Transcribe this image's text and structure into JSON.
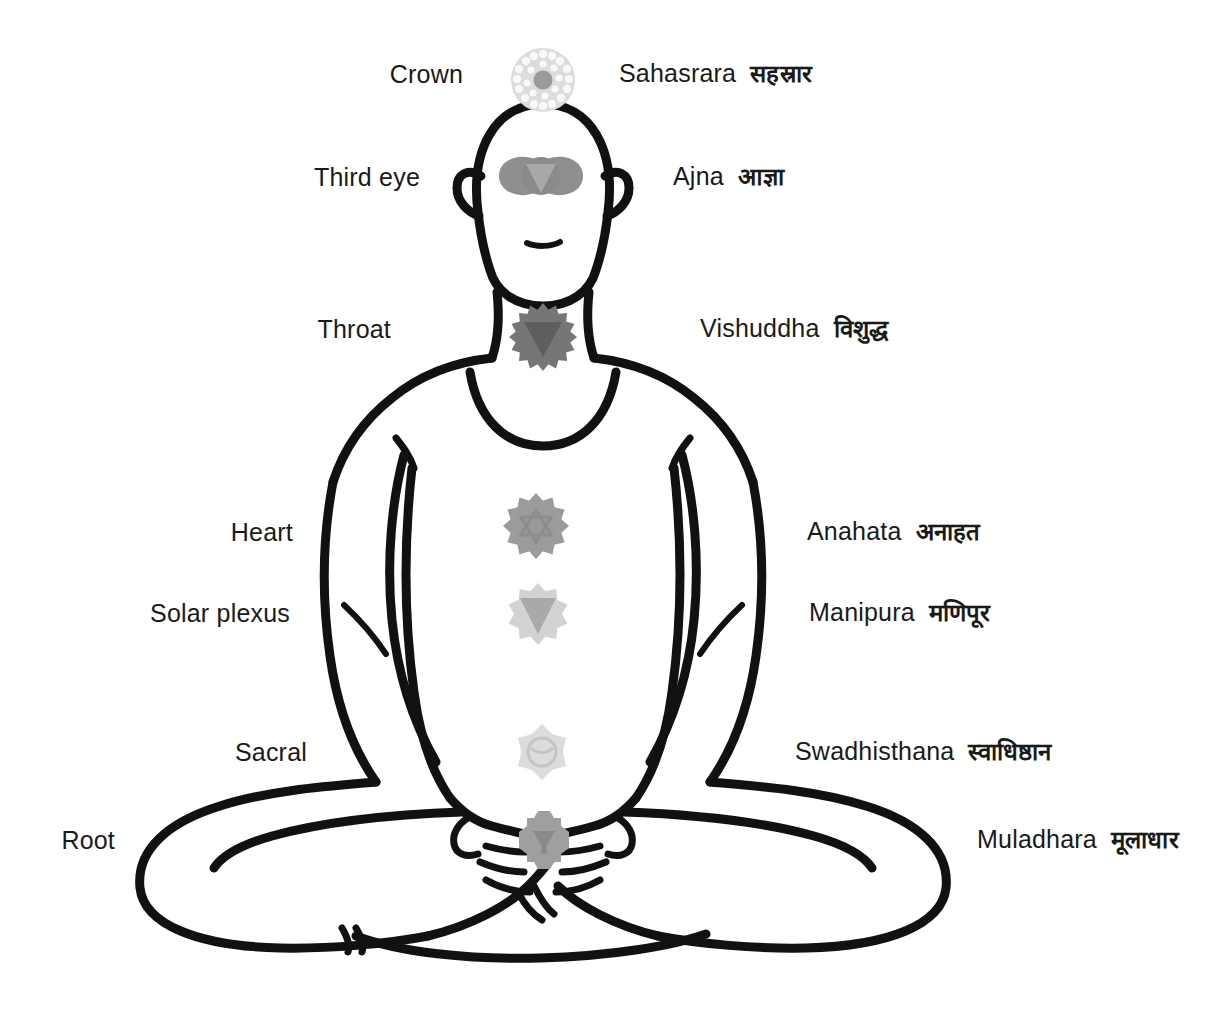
{
  "diagram": {
    "background_color": "#ffffff",
    "line_color": "#111111",
    "text_color": "#1a1a1a",
    "figure": {
      "pose": "padmasana-seated-lotus",
      "description": "Line-art silhouette of a bald person seated cross-legged in lotus position with hands resting in the lap"
    }
  },
  "chakras": [
    {
      "index": 1,
      "english_name": "Crown",
      "sanskrit_name": "Sahasrara",
      "devanagari": "सहस्रार",
      "petals": 1000,
      "shape": "thousand-petal-circle",
      "color": "#d9d9d9",
      "center_color": "#9a9a9a",
      "left_label_x": 463,
      "left_label_y": 75,
      "right_label_x": 619,
      "right_label_y": 74,
      "icon_cx": 543,
      "icon_cy": 80,
      "icon_r": 33
    },
    {
      "index": 2,
      "english_name": "Third eye",
      "sanskrit_name": "Ajna",
      "devanagari": "आज्ञा",
      "petals": 2,
      "shape": "two-petal-eye",
      "color": "#8f8f8f",
      "center_color": "#a5a5a5",
      "left_label_x": 420,
      "left_label_y": 177,
      "right_label_x": 673,
      "right_label_y": 177,
      "icon_cx": 541,
      "icon_cy": 176,
      "icon_r": 30
    },
    {
      "index": 3,
      "english_name": "Throat",
      "sanskrit_name": "Vishuddha",
      "devanagari": "विशुद्ध",
      "petals": 16,
      "shape": "sixteen-petal-circle",
      "color": "#767676",
      "center_color": "#5e5e5e",
      "left_label_x": 391,
      "left_label_y": 329,
      "right_label_x": 700,
      "right_label_y": 329,
      "icon_cx": 543,
      "icon_cy": 337,
      "icon_r": 30
    },
    {
      "index": 4,
      "english_name": "Heart",
      "sanskrit_name": "Anahata",
      "devanagari": "अनाहत",
      "petals": 12,
      "shape": "twelve-petal-circle",
      "color": "#9b9b9b",
      "center_color": "#8d8d8d",
      "left_label_x": 293,
      "left_label_y": 532,
      "right_label_x": 807,
      "right_label_y": 532,
      "icon_cx": 536,
      "icon_cy": 526,
      "icon_r": 30
    },
    {
      "index": 5,
      "english_name": "Solar plexus",
      "sanskrit_name": "Manipura",
      "devanagari": "मणिपूर",
      "petals": 10,
      "shape": "ten-petal-circle",
      "color": "#d2d2d2",
      "center_color": "#a9a9a9",
      "left_label_x": 290,
      "left_label_y": 613,
      "right_label_x": 809,
      "right_label_y": 612,
      "icon_cx": 538,
      "icon_cy": 614,
      "icon_r": 28
    },
    {
      "index": 6,
      "english_name": "Sacral",
      "sanskrit_name": "Swadhisthana",
      "devanagari": "स्वाधिष्ठान",
      "petals": 6,
      "shape": "six-petal-circle",
      "color": "#dcdcdc",
      "center_color": "#cfcfcf",
      "left_label_x": 307,
      "left_label_y": 752,
      "right_label_x": 795,
      "right_label_y": 751,
      "icon_cx": 542,
      "icon_cy": 752,
      "icon_r": 26
    },
    {
      "index": 7,
      "english_name": "Root",
      "sanskrit_name": "Muladhara",
      "devanagari": "मूलाधार",
      "petals": 4,
      "shape": "four-petal-square",
      "color": "#9f9f9f",
      "center_color": "#8a8a8a",
      "left_label_x": 115,
      "left_label_y": 840,
      "right_label_x": 977,
      "right_label_y": 840,
      "icon_cx": 544,
      "icon_cy": 840,
      "icon_r": 24
    }
  ]
}
